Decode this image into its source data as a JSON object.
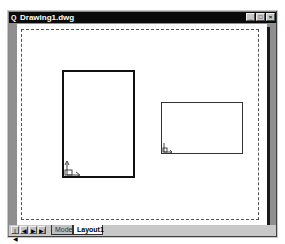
{
  "window": {
    "title": "Drawing1.dwg",
    "app_icon": "Q",
    "controls": {
      "minimize": "_",
      "maximize": "□",
      "close": "×"
    }
  },
  "layout": {
    "viewports": [
      {
        "name": "viewport-1",
        "orientation": "portrait"
      },
      {
        "name": "viewport-2",
        "orientation": "landscape"
      }
    ]
  },
  "tabs": {
    "nav": [
      "|◀",
      "◀",
      "▶",
      "▶|"
    ],
    "items": [
      {
        "label": "Model",
        "active": false
      },
      {
        "label": "Layout1",
        "active": true
      }
    ]
  }
}
